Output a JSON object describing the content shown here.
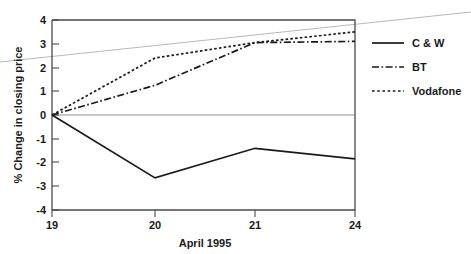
{
  "chart_data": {
    "type": "line",
    "title": "",
    "xlabel": "April 1995",
    "ylabel": "% Change in closing price",
    "x": [
      19,
      20,
      21,
      24
    ],
    "xtick_labels": [
      "19",
      "20",
      "21",
      "24"
    ],
    "ytick_labels": [
      "4",
      "3",
      "2",
      "1",
      "0",
      "-1",
      "-2",
      "-3",
      "-4"
    ],
    "ylim": [
      -4,
      4
    ],
    "xlim": [
      19,
      24
    ],
    "grid": false,
    "legend_position": "right",
    "series": [
      {
        "name": "C & W",
        "style": "solid",
        "values": [
          0.0,
          -2.65,
          -1.4,
          -1.85
        ]
      },
      {
        "name": "BT",
        "style": "dash-dot",
        "values": [
          0.0,
          1.25,
          3.05,
          3.1
        ]
      },
      {
        "name": "Vodafone",
        "style": "dotted",
        "values": [
          0.0,
          2.4,
          3.05,
          3.5
        ]
      }
    ]
  },
  "axes": {
    "y_title": "% Change in closing price",
    "x_title": "April 1995",
    "y_ticks": [
      {
        "label": "4",
        "value": 4
      },
      {
        "label": "3",
        "value": 3
      },
      {
        "label": "2",
        "value": 2
      },
      {
        "label": "1",
        "value": 1
      },
      {
        "label": "0",
        "value": 0
      },
      {
        "label": "-1",
        "value": -1
      },
      {
        "label": "-2",
        "value": -2
      },
      {
        "label": "-3",
        "value": -3
      },
      {
        "label": "-4",
        "value": -4
      }
    ],
    "x_ticks": [
      {
        "label": "19",
        "value": 19
      },
      {
        "label": "20",
        "value": 20
      },
      {
        "label": "21",
        "value": 21
      },
      {
        "label": "24",
        "value": 24
      }
    ]
  },
  "legend": {
    "entries": [
      {
        "label": "C & W",
        "style": "solid"
      },
      {
        "label": "BT",
        "style": "dash-dot"
      },
      {
        "label": "Vodafone",
        "style": "dotted"
      }
    ]
  },
  "colors": {
    "ink": "#1a1a1a",
    "axis": "#4a4a4a",
    "zero_rule": "#8f8f8f",
    "artifact": "#b9b9b9",
    "background": "#ffffff"
  }
}
